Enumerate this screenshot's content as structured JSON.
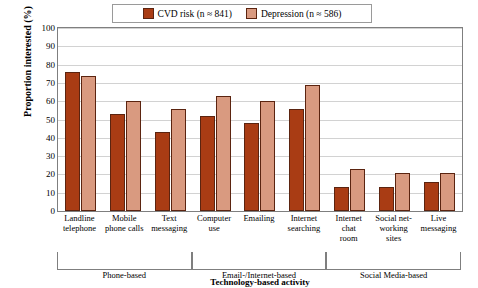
{
  "chart_data": {
    "type": "bar",
    "title": "",
    "xlabel": "Technology-based activity",
    "ylabel": "Proportion interested (%)",
    "ylim": [
      0,
      100
    ],
    "ytick_step": 10,
    "grid": true,
    "legend_position": "top-center",
    "categories": [
      "Landline telephone",
      "Mobile phone calls",
      "Text messaging",
      "Computer use",
      "Emailing",
      "Internet searching",
      "Internet chat room",
      "Social networking sites",
      "Live messaging"
    ],
    "category_lines": [
      [
        "Landline",
        "telephone"
      ],
      [
        "Mobile",
        "phone calls"
      ],
      [
        "Text",
        "messaging"
      ],
      [
        "Computer",
        "use"
      ],
      [
        "Emailing"
      ],
      [
        "Internet",
        "searching"
      ],
      [
        "Internet",
        "chat",
        "room"
      ],
      [
        "Social net-",
        "working",
        "sites"
      ],
      [
        "Live",
        "messaging"
      ]
    ],
    "series": [
      {
        "name": "CVD risk (n ≈ 841)",
        "color": "#a93c14",
        "values": [
          76,
          53,
          43,
          52,
          48,
          56,
          13,
          13,
          16
        ]
      },
      {
        "name": "Depression (n ≈ 586)",
        "color": "#d99a80",
        "values": [
          74,
          60,
          56,
          63,
          60,
          69,
          23,
          21,
          21
        ]
      }
    ],
    "ytick_labels": [
      "0",
      "10",
      "20",
      "30",
      "40",
      "50",
      "60",
      "70",
      "80",
      "90",
      "100"
    ],
    "groupings": [
      {
        "label": "Phone-based",
        "categories": 3
      },
      {
        "label": "Email-/Internet-based",
        "categories": 3
      },
      {
        "label": "Social Media-based",
        "categories": 3
      }
    ]
  }
}
